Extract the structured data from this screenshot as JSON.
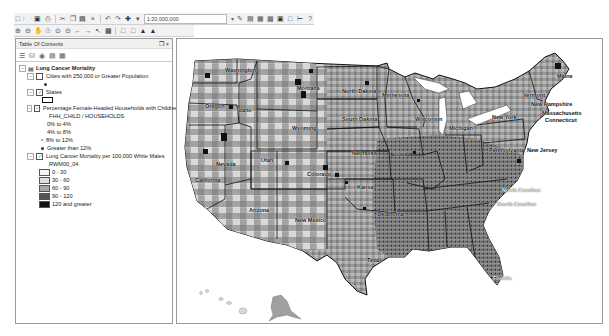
{
  "toolbar": {
    "row1_icons": [
      "new-icon",
      "open-icon",
      "save-icon",
      "print-icon",
      "cut-icon",
      "copy-icon",
      "paste-icon",
      "delete-icon",
      "undo-icon",
      "redo-icon",
      "add-data-icon"
    ],
    "scale_value": "1:20,000,000",
    "row1_right_icons": [
      "editor-icon",
      "toc-window-icon",
      "catalog-icon",
      "search-window-icon",
      "arctoolbox-icon",
      "python-icon",
      "model-icon",
      "help-icon"
    ],
    "row2_icons": [
      "zoom-in-icon",
      "zoom-out-icon",
      "fixed-zoom-in-icon",
      "fixed-zoom-out-icon",
      "full-extent-icon",
      "pan-icon",
      "back-icon",
      "forward-icon",
      "select-icon",
      "identify-icon",
      "find-icon",
      "measure-icon",
      "html-popup-icon"
    ]
  },
  "toc": {
    "title": "Table Of Contents",
    "pin": "❒",
    "close": "×",
    "root_layer": "Lung Cancer Mortality",
    "layers": [
      {
        "name": "Cities with 250,000 or Greater Population",
        "checked": false
      },
      {
        "name": "States",
        "checked": true
      },
      {
        "name": "Percentage Female-Headed Households with Children",
        "checked": true,
        "field": "FHH_CHILD / HOUSEHOLDS",
        "classes": [
          "0% to 4%",
          "4% to 8%",
          "8% to 12%",
          "Greater than 12%"
        ]
      },
      {
        "name": "Lung Cancer Mortality per 100,000 White Males",
        "checked": true,
        "field": "RWM00_04",
        "classes": [
          {
            "label": "0 - 30",
            "color": "#f4f4f4"
          },
          {
            "label": "30 - 60",
            "color": "#dedede"
          },
          {
            "label": "60 - 90",
            "color": "#a8a8a8"
          },
          {
            "label": "90 - 120",
            "color": "#555555"
          },
          {
            "label": "120 and greater",
            "color": "#111111"
          }
        ]
      }
    ]
  },
  "map": {
    "state_labels": [
      {
        "name": "Washington",
        "x": 48,
        "y": 28
      },
      {
        "name": "Montana",
        "x": 120,
        "y": 46
      },
      {
        "name": "North Dakota",
        "x": 165,
        "y": 49
      },
      {
        "name": "Oregon",
        "x": 28,
        "y": 64
      },
      {
        "name": "Idaho",
        "x": 60,
        "y": 68
      },
      {
        "name": "Wyoming",
        "x": 115,
        "y": 86
      },
      {
        "name": "South Dakota",
        "x": 165,
        "y": 77
      },
      {
        "name": "Minnesota",
        "x": 205,
        "y": 53
      },
      {
        "name": "Wisconsin",
        "x": 238,
        "y": 77
      },
      {
        "name": "Michigan",
        "x": 272,
        "y": 86
      },
      {
        "name": "Maine",
        "x": 380,
        "y": 34
      },
      {
        "name": "Vermont",
        "x": 346,
        "y": 53
      },
      {
        "name": "New Hampshire",
        "x": 354,
        "y": 62
      },
      {
        "name": "Massachusetts",
        "x": 365,
        "y": 71
      },
      {
        "name": "New York",
        "x": 315,
        "y": 75
      },
      {
        "name": "Connecticut",
        "x": 368,
        "y": 78
      },
      {
        "name": "Nevada",
        "x": 39,
        "y": 122
      },
      {
        "name": "Utah",
        "x": 84,
        "y": 118
      },
      {
        "name": "Nebraska",
        "x": 175,
        "y": 111
      },
      {
        "name": "Iowa",
        "x": 218,
        "y": 112
      },
      {
        "name": "Pennsylvania",
        "x": 312,
        "y": 108
      },
      {
        "name": "New Jersey",
        "x": 350,
        "y": 108
      },
      {
        "name": "California",
        "x": 18,
        "y": 138
      },
      {
        "name": "Colorado",
        "x": 130,
        "y": 132
      },
      {
        "name": "Kansas",
        "x": 180,
        "y": 145
      },
      {
        "name": "Arizona",
        "x": 72,
        "y": 168
      },
      {
        "name": "New Mexico",
        "x": 118,
        "y": 178
      },
      {
        "name": "Oklahoma",
        "x": 200,
        "y": 172
      },
      {
        "name": "Texas",
        "x": 190,
        "y": 218
      },
      {
        "name": "North Carolina",
        "x": 325,
        "y": 148
      },
      {
        "name": "South Carolina",
        "x": 320,
        "y": 162
      },
      {
        "name": "Florida",
        "x": 316,
        "y": 236
      }
    ]
  },
  "colors": {
    "class_0": "#f4f4f4",
    "class_1": "#dedede",
    "class_2": "#a8a8a8",
    "class_3": "#555555",
    "class_4": "#111111"
  }
}
